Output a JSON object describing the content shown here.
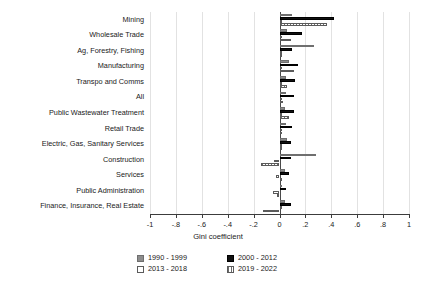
{
  "chart_data": {
    "type": "bar",
    "orientation": "horizontal",
    "title": "",
    "xlabel": "Gini coefficient",
    "ylabel": "",
    "xlim": [
      -1,
      1
    ],
    "xticks": [
      "-1",
      "-.8",
      "-.6",
      "-.4",
      "-.2",
      "0",
      ".2",
      ".4",
      ".6",
      ".8",
      "1"
    ],
    "xtick_values": [
      -1,
      -0.8,
      -0.6,
      -0.4,
      -0.2,
      0,
      0.2,
      0.4,
      0.6,
      0.8,
      1
    ],
    "grid": true,
    "legend_position": "bottom",
    "categories": [
      "Mining",
      "Wholesale Trade",
      "Ag, Forestry, Fishing",
      "Manufacturing",
      "Transpo and Comms",
      "All",
      "Public Wastewater Treatment",
      "Retail Trade",
      "Electric, Gas, Sanitary Services",
      "Construction",
      "Services",
      "Public Administration",
      "Finance, Insurance, Real Estate"
    ],
    "series": [
      {
        "name": "1990 - 1999",
        "color": "#8d8d8d",
        "fill": "solid-gray",
        "values": [
          0.1,
          0.06,
          0.27,
          0.07,
          0.05,
          0.05,
          0.04,
          0.05,
          0.06,
          0.28,
          0.04,
          0.02,
          0.04
        ]
      },
      {
        "name": "2000 - 2012",
        "color": "#111111",
        "fill": "solid-black",
        "values": [
          0.42,
          0.17,
          0.1,
          0.14,
          0.12,
          0.11,
          0.11,
          0.1,
          0.09,
          0.09,
          0.07,
          0.05,
          0.09
        ]
      },
      {
        "name": "2013 - 2018",
        "color": "#ffffff",
        "fill": "hollow",
        "values": [
          0.02,
          0.01,
          0.01,
          0.02,
          0.02,
          0.02,
          0.02,
          0.02,
          0.02,
          -0.04,
          -0.03,
          -0.05,
          0.01
        ]
      },
      {
        "name": "2019 - 2022",
        "color": "#6b6b6b",
        "fill": "hatched",
        "values": [
          0.37,
          0.09,
          0.02,
          0.11,
          0.06,
          0.03,
          0.07,
          0.02,
          0.02,
          -0.14,
          0.01,
          -0.02,
          -0.13
        ]
      }
    ]
  },
  "legend": {
    "items": [
      {
        "label": "1990 - 1999",
        "fill": "solid-gray"
      },
      {
        "label": "2000 - 2012",
        "fill": "solid-black"
      },
      {
        "label": "2013 - 2018",
        "fill": "hollow"
      },
      {
        "label": "2019 - 2022",
        "fill": "hatched"
      }
    ]
  }
}
